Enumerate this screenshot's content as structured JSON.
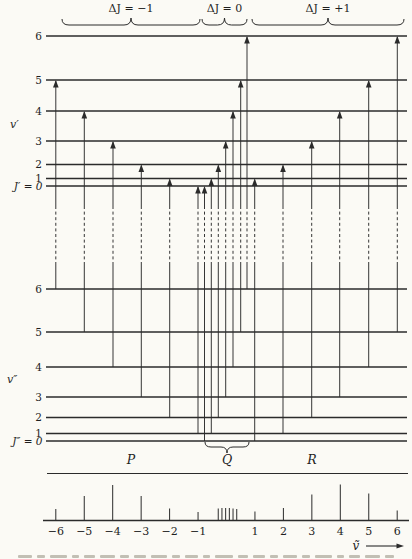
{
  "figure": {
    "ink": "#2b2b2b",
    "background": "#fbfaf5",
    "branch_groups": [
      {
        "label": "ΔJ = −1",
        "x_start": 62,
        "x_end": 200
      },
      {
        "label": "ΔJ = 0",
        "x_start": 202,
        "x_end": 247
      },
      {
        "label": "ΔJ = +1",
        "x_start": 252,
        "x_end": 404
      }
    ],
    "upper_state": {
      "state_label": "v′",
      "j_zero_label": "J′ = 0",
      "level_labels": [
        "1",
        "2",
        "3",
        "4",
        "5",
        "6"
      ]
    },
    "lower_state": {
      "state_label": "v″",
      "j_zero_label": "J″ = 0",
      "level_labels": [
        "1",
        "2",
        "3",
        "4",
        "5",
        "6"
      ]
    },
    "branch_letters": {
      "p": "P",
      "q": "Q",
      "r": "R"
    },
    "transitions": [
      {
        "name": "P(6)",
        "branch": "P",
        "j_lower": 6,
        "j_upper": 5,
        "x": 55.8
      },
      {
        "name": "P(5)",
        "branch": "P",
        "j_lower": 5,
        "j_upper": 4,
        "x": 84.3
      },
      {
        "name": "P(4)",
        "branch": "P",
        "j_lower": 4,
        "j_upper": 3,
        "x": 113.0
      },
      {
        "name": "P(3)",
        "branch": "P",
        "j_lower": 3,
        "j_upper": 2,
        "x": 141.3
      },
      {
        "name": "P(2)",
        "branch": "P",
        "j_lower": 2,
        "j_upper": 1,
        "x": 169.7
      },
      {
        "name": "P(1)",
        "branch": "P",
        "j_lower": 1,
        "j_upper": 0,
        "x": 198.0
      },
      {
        "name": "Q(0)",
        "branch": "Q",
        "j_lower": 0,
        "j_upper": 0,
        "x": 204.5
      },
      {
        "name": "Q(1)",
        "branch": "Q",
        "j_lower": 1,
        "j_upper": 1,
        "x": 211.3
      },
      {
        "name": "Q(2)",
        "branch": "Q",
        "j_lower": 2,
        "j_upper": 2,
        "x": 218.3
      },
      {
        "name": "Q(3)",
        "branch": "Q",
        "j_lower": 3,
        "j_upper": 3,
        "x": 225.7
      },
      {
        "name": "Q(4)",
        "branch": "Q",
        "j_lower": 4,
        "j_upper": 4,
        "x": 233.0
      },
      {
        "name": "Q(5)",
        "branch": "Q",
        "j_lower": 5,
        "j_upper": 5,
        "x": 240.7
      },
      {
        "name": "Q(6)",
        "branch": "Q",
        "j_lower": 6,
        "j_upper": 6,
        "x": 247.0
      },
      {
        "name": "R(0)",
        "branch": "R",
        "j_lower": 0,
        "j_upper": 1,
        "x": 254.7
      },
      {
        "name": "R(1)",
        "branch": "R",
        "j_lower": 1,
        "j_upper": 2,
        "x": 283.0
      },
      {
        "name": "R(2)",
        "branch": "R",
        "j_lower": 2,
        "j_upper": 3,
        "x": 311.7
      },
      {
        "name": "R(3)",
        "branch": "R",
        "j_lower": 3,
        "j_upper": 4,
        "x": 339.7
      },
      {
        "name": "R(4)",
        "branch": "R",
        "j_lower": 4,
        "j_upper": 5,
        "x": 368.7
      },
      {
        "name": "R(5)",
        "branch": "R",
        "j_lower": 5,
        "j_upper": 6,
        "x": 397.3
      }
    ],
    "q_underbrace": {
      "x_start": 205,
      "x_end": 249
    },
    "axis_label": "ṽ"
  },
  "chart_data": {
    "type": "bar",
    "xlabel": "ṽ",
    "ylabel": "",
    "xlim": [
      -6.5,
      6.5
    ],
    "x": [
      -6,
      -5,
      -4,
      -3,
      -2,
      -1,
      -0.29,
      -0.16,
      -0.03,
      0.1,
      0.23,
      0.36,
      1,
      2,
      3,
      4,
      5,
      6
    ],
    "values": [
      11,
      24,
      35,
      24,
      11.5,
      8,
      11.5,
      12,
      12,
      12,
      11.5,
      11,
      8.5,
      12,
      25.5,
      35.5,
      26.5,
      9.5
    ],
    "tick_positions": [
      -6,
      -5,
      -4,
      -3,
      -2,
      -1,
      1,
      2,
      3,
      4,
      5,
      6
    ],
    "tick_labels": [
      "−6",
      "−5",
      "−4",
      "−3",
      "−2",
      "−1",
      "1",
      "2",
      "3",
      "4",
      "5",
      "6"
    ],
    "legend": []
  }
}
